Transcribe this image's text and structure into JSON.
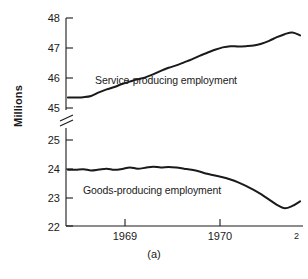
{
  "figure": {
    "caption": "(a)",
    "ylabel": "Millions"
  },
  "chart_data": {
    "type": "line",
    "title": "",
    "xlabel": "",
    "ylabel": "Millions",
    "grid": false,
    "legend_position": "inline-annotation",
    "broken_axis": true,
    "axis_break_note": "y-axis broken between 45 and 25",
    "panels": [
      {
        "name": "upper",
        "ylim": [
          45,
          48
        ],
        "yticks": [
          45,
          46,
          47,
          48
        ],
        "ytick_labels": [
          "45",
          "46",
          "47",
          "48"
        ]
      },
      {
        "name": "lower",
        "ylim": [
          22,
          25
        ],
        "yticks": [
          22,
          23,
          24,
          25
        ],
        "ytick_labels": [
          "22",
          "23",
          "24",
          "25"
        ]
      }
    ],
    "xlim": [
      1968.6,
      1971.05
    ],
    "xticks": [
      1969,
      1970,
      1971
    ],
    "xtick_labels": [
      "1969",
      "1970",
      "1971"
    ],
    "xtick_last_clipped": "2",
    "series": [
      {
        "name": "Service-producing employment",
        "panel": "upper",
        "label": "Service-producing employment",
        "x": [
          1968.62,
          1968.7,
          1968.78,
          1968.86,
          1968.94,
          1969.02,
          1969.1,
          1969.18,
          1969.26,
          1969.34,
          1969.42,
          1969.5,
          1969.58,
          1969.66,
          1969.74,
          1969.82,
          1969.9,
          1969.98,
          1970.06,
          1970.14,
          1970.22,
          1970.3,
          1970.38,
          1970.46,
          1970.54,
          1970.62,
          1970.7,
          1970.78,
          1970.86,
          1970.94,
          1971.02
        ],
        "values": [
          45.35,
          45.35,
          45.36,
          45.4,
          45.52,
          45.62,
          45.7,
          45.8,
          45.88,
          45.96,
          46.02,
          46.12,
          46.24,
          46.34,
          46.42,
          46.52,
          46.62,
          46.74,
          46.84,
          46.94,
          47.02,
          47.06,
          47.05,
          47.06,
          47.08,
          47.14,
          47.24,
          47.36,
          47.46,
          47.52,
          47.42
        ]
      },
      {
        "name": "Goods-producing employment",
        "panel": "lower",
        "label": "Goods-producing employment",
        "x": [
          1968.62,
          1968.7,
          1968.78,
          1968.86,
          1968.94,
          1969.02,
          1969.1,
          1969.18,
          1969.26,
          1969.34,
          1969.42,
          1969.5,
          1969.58,
          1969.66,
          1969.74,
          1969.82,
          1969.9,
          1969.98,
          1970.06,
          1970.14,
          1970.22,
          1970.3,
          1970.38,
          1970.46,
          1970.54,
          1970.62,
          1970.7,
          1970.78,
          1970.86,
          1970.94,
          1971.02
        ],
        "values": [
          23.96,
          23.96,
          23.98,
          23.94,
          23.97,
          24.0,
          23.96,
          23.99,
          24.04,
          24.0,
          24.03,
          24.07,
          24.04,
          24.06,
          24.04,
          24.0,
          23.96,
          23.9,
          23.82,
          23.76,
          23.7,
          23.62,
          23.52,
          23.4,
          23.26,
          23.1,
          22.92,
          22.74,
          22.62,
          22.7,
          22.86
        ]
      }
    ]
  }
}
